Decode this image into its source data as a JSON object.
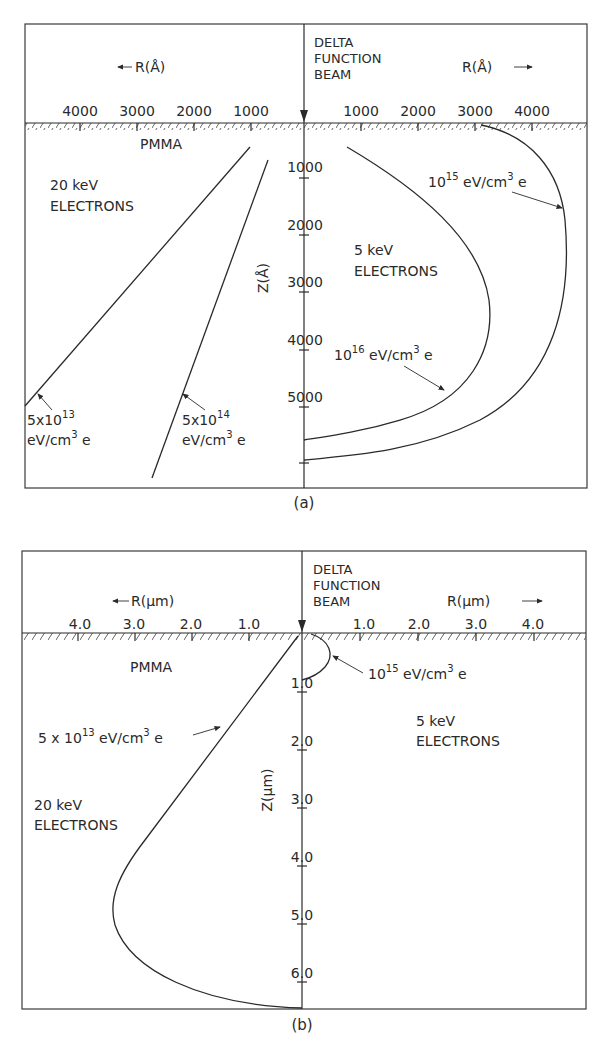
{
  "panel_a": {
    "caption": "(a)",
    "beam_label": [
      "DELTA",
      "FUNCTION",
      "BEAM"
    ],
    "r_axis_left": "R(Å)",
    "r_axis_right": "R(Å)",
    "r_ticks_left": [
      "4000",
      "3000",
      "2000",
      "1000"
    ],
    "r_ticks_right": [
      "1000",
      "2000",
      "3000",
      "4000"
    ],
    "z_axis_label": "Z(Å)",
    "z_ticks": [
      "1000",
      "2000",
      "3000",
      "4000",
      "5000"
    ],
    "material": "PMMA",
    "left_group": [
      "20 keV",
      "ELECTRONS"
    ],
    "right_group": [
      "5 keV",
      "ELECTRONS"
    ],
    "contours": [
      {
        "id": "a-20kev-5e13",
        "mantissa": "5x10",
        "exp": "13",
        "unit": "eV/cm",
        "unit_exp": "3",
        "suffix": "e"
      },
      {
        "id": "a-20kev-5e14",
        "mantissa": "5x10",
        "exp": "14",
        "unit": "eV/cm",
        "unit_exp": "3",
        "suffix": "e"
      },
      {
        "id": "a-5kev-1e15",
        "mantissa": "10",
        "exp": "15",
        "unit": "eV/cm",
        "unit_exp": "3",
        "suffix": "e"
      },
      {
        "id": "a-5kev-1e16",
        "mantissa": "10",
        "exp": "16",
        "unit": "eV/cm",
        "unit_exp": "3",
        "suffix": "e"
      }
    ]
  },
  "panel_b": {
    "caption": "(b)",
    "beam_label": [
      "DELTA",
      "FUNCTION",
      "BEAM"
    ],
    "r_axis_left": "R(μm)",
    "r_axis_right": "R(μm)",
    "r_ticks_left": [
      "4.0",
      "3.0",
      "2.0",
      "1.0"
    ],
    "r_ticks_right": [
      "1.0",
      "2.0",
      "3.0",
      "4.0"
    ],
    "z_axis_label": "Z(μm)",
    "z_ticks": [
      "1.0",
      "2.0",
      "3.0",
      "4.0",
      "5.0",
      "6.0"
    ],
    "material": "PMMA",
    "left_group": [
      "20 keV",
      "ELECTRONS"
    ],
    "right_group": [
      "5 keV",
      "ELECTRONS"
    ],
    "contours": [
      {
        "id": "b-20kev-5e13",
        "mantissa": "5 x 10",
        "exp": "13",
        "unit": "eV/cm",
        "unit_exp": "3",
        "suffix": "e"
      },
      {
        "id": "b-5kev-1e15",
        "mantissa": "10",
        "exp": "15",
        "unit": "eV/cm",
        "unit_exp": "3",
        "suffix": "e"
      }
    ]
  }
}
